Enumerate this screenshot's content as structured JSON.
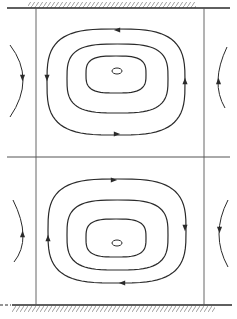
{
  "diagram": {
    "type": "streamline-flow-cells",
    "colors": {
      "background": "#ffffff",
      "line": "#2a2a2a",
      "grid": "#555555",
      "hatch": "#777777"
    },
    "walls": {
      "top": {
        "y": 8,
        "x1": 7,
        "x2": 230,
        "hatch_x1": 28,
        "hatch_x2": 196,
        "hatch_side": "above"
      },
      "bottom": {
        "y": 305,
        "x1": 12,
        "x2": 232,
        "dash_x1": 0,
        "dash_x2": 11,
        "hatch_x1": 12,
        "hatch_x2": 215,
        "hatch_side": "below"
      }
    },
    "divider": {
      "y": 157,
      "x1": 7,
      "x2": 230
    },
    "verticals": [
      {
        "x": 36,
        "y1": 8,
        "y2": 305
      },
      {
        "x": 204,
        "y1": 8,
        "y2": 305
      }
    ],
    "cells": [
      {
        "name": "upper-cell",
        "rotation": "counter-clockwise",
        "center": {
          "x": 117,
          "y": 71
        },
        "core": {
          "rx": 5,
          "ry": 3
        },
        "loops": [
          {
            "x1": 47,
            "x2": 185,
            "y1": 29,
            "y2": 135
          },
          {
            "x1": 67,
            "x2": 168,
            "y1": 44,
            "y2": 113
          },
          {
            "x1": 86,
            "x2": 146,
            "y1": 56,
            "y2": 93
          }
        ],
        "arrows": [
          {
            "x": 117,
            "y": 30,
            "dir": "left"
          },
          {
            "x": 47,
            "y": 78,
            "dir": "down"
          },
          {
            "x": 117,
            "y": 134,
            "dir": "right"
          },
          {
            "x": 185,
            "y": 81,
            "dir": "up"
          }
        ],
        "side_arcs": [
          {
            "side": "left",
            "x_top": 10,
            "y_top": 45,
            "x_mid": 23,
            "y_mid": 80,
            "x_bot": 10,
            "y_bot": 117,
            "arrow_dir": "down",
            "arrow_y": 78
          },
          {
            "side": "right",
            "x_top": 227,
            "y_top": 47,
            "x_mid": 218,
            "y_mid": 80,
            "x_bot": 225,
            "y_bot": 108,
            "arrow_dir": "up",
            "arrow_y": 81
          }
        ]
      },
      {
        "name": "lower-cell",
        "rotation": "clockwise",
        "center": {
          "x": 117,
          "y": 243
        },
        "core": {
          "rx": 5,
          "ry": 3
        },
        "loops": [
          {
            "x1": 48,
            "x2": 186,
            "y1": 179,
            "y2": 283
          },
          {
            "x1": 67,
            "x2": 168,
            "y1": 200,
            "y2": 270
          },
          {
            "x1": 86,
            "x2": 146,
            "y1": 219,
            "y2": 257
          }
        ],
        "arrows": [
          {
            "x": 114,
            "y": 180,
            "dir": "right"
          },
          {
            "x": 185,
            "y": 228,
            "dir": "down"
          },
          {
            "x": 122,
            "y": 283,
            "dir": "left"
          },
          {
            "x": 48,
            "y": 238,
            "dir": "up"
          }
        ],
        "side_arcs": [
          {
            "side": "left",
            "x_top": 13,
            "y_top": 200,
            "x_mid": 23,
            "y_mid": 235,
            "x_bot": 14,
            "y_bot": 262,
            "arrow_dir": "up",
            "arrow_y": 234
          },
          {
            "side": "right",
            "x_top": 228,
            "y_top": 200,
            "x_mid": 219,
            "y_mid": 234,
            "x_bot": 228,
            "y_bot": 267,
            "arrow_dir": "down",
            "arrow_y": 230
          }
        ]
      }
    ]
  }
}
